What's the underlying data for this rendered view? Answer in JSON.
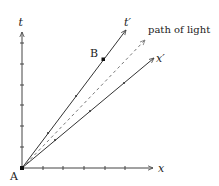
{
  "diagram": {
    "type": "spacetime-diagram",
    "labels": {
      "t_axis": "t",
      "x_axis": "x",
      "t_prime": "t′",
      "x_prime": "x′",
      "light": "path of light",
      "point_a": "A",
      "point_b": "B"
    },
    "colors": {
      "axis": "#444444",
      "worldline": "#333333",
      "light": "#777777",
      "point": "#111111"
    },
    "ticks": {
      "t_axis_count": 6,
      "x_axis_count": 5,
      "t_prime_count": 2,
      "x_prime_count": 3
    }
  }
}
